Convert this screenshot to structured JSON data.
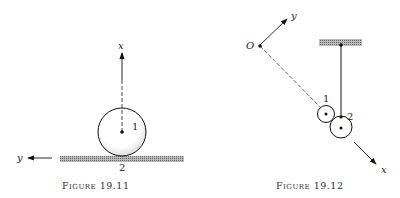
{
  "figure_left": {
    "caption": "Figure 19.11",
    "axis_x_label": "x",
    "axis_y_label": "y",
    "body_label": "1",
    "ground_label": "2"
  },
  "figure_right": {
    "caption": "Figure 19.12",
    "origin_label": "O",
    "axis_x_label": "x",
    "axis_y_label": "y",
    "small_disk_label": "1",
    "large_disk_label": "2"
  }
}
